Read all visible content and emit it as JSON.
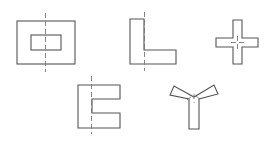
{
  "diagram": {
    "colors": {
      "background": "#ffffff",
      "outline": "#555555",
      "axis": "#777777"
    },
    "shapes": [
      {
        "name": "hollow-rectangle",
        "has_axis": true
      },
      {
        "name": "l-shape",
        "has_axis": true
      },
      {
        "name": "cross-shape",
        "has_axis": false
      },
      {
        "name": "e-shape",
        "has_axis": true
      },
      {
        "name": "y-shape",
        "has_axis": false
      }
    ]
  }
}
